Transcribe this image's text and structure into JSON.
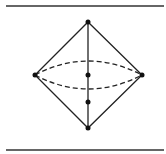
{
  "diagram": {
    "type": "octahedron-wireframe",
    "colors": {
      "stroke": "#222222",
      "background": "#ffffff"
    },
    "rules": [
      {
        "x1": 6,
        "y1": 6,
        "x2": 164,
        "y2": 6
      },
      {
        "x1": 6,
        "y1": 150,
        "x2": 164,
        "y2": 150
      }
    ],
    "vertices": {
      "top": [
        88,
        22
      ],
      "left": [
        35,
        75
      ],
      "right": [
        142,
        75
      ],
      "bottom": [
        88,
        128
      ],
      "center": [
        88,
        75
      ],
      "lower_mid": [
        88,
        102
      ]
    },
    "ellipse": {
      "cx": 88.5,
      "cy": 75,
      "rx": 53.5,
      "ry": 14,
      "dashed": true
    }
  }
}
